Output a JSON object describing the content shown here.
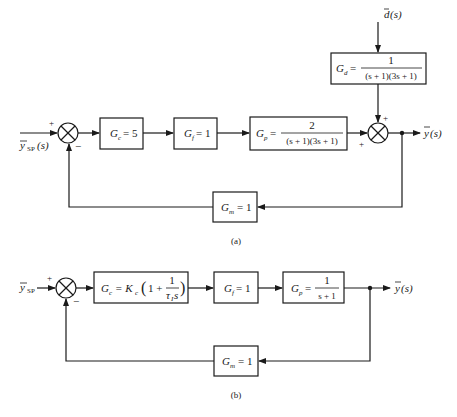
{
  "diagrams": [
    {
      "caption": "(a)",
      "input": {
        "symbol": "y",
        "subscript": "SP",
        "arg": "(s)",
        "sign": "+"
      },
      "summer1": {
        "feedback_sign": "−"
      },
      "blocks": {
        "controller": {
          "name": "G",
          "sub": "c",
          "expr": "= 5"
        },
        "final_element": {
          "name": "G",
          "sub": "f",
          "expr": "= 1"
        },
        "process": {
          "name": "G",
          "sub": "p",
          "eq": "=",
          "numerator": "2",
          "denominator": "(s + 1)(3s + 1)"
        },
        "disturbance": {
          "name": "G",
          "sub": "d",
          "eq": "=",
          "numerator": "1",
          "denominator": "(s + 1)(3s + 1)"
        },
        "measurement": {
          "name": "G",
          "sub": "m",
          "expr": "= 1"
        }
      },
      "disturbance_input": {
        "symbol": "d",
        "arg": "(s)"
      },
      "summer2": {
        "signs": [
          "+",
          "+"
        ]
      },
      "output": {
        "symbol": "y",
        "arg": "(s)"
      }
    },
    {
      "caption": "(b)",
      "input": {
        "symbol": "y",
        "subscript": "SP",
        "sign": "+"
      },
      "summer1": {
        "feedback_sign": "−"
      },
      "blocks": {
        "controller": {
          "name": "G",
          "sub": "c",
          "eq": "= K",
          "ksub": "c",
          "paren_open": "(",
          "one_plus": "1 +",
          "numerator": "1",
          "denominator": "τ",
          "den_sub": "I",
          "den_s": "s",
          "paren_close": ")"
        },
        "final_element": {
          "name": "G",
          "sub": "f",
          "expr": "= 1"
        },
        "process": {
          "name": "G",
          "sub": "p",
          "eq": "=",
          "numerator": "1",
          "denominator": "s + 1"
        },
        "measurement": {
          "name": "G",
          "sub": "m",
          "expr": "= 1"
        }
      },
      "output": {
        "symbol": "y",
        "arg": "(s)"
      }
    }
  ]
}
